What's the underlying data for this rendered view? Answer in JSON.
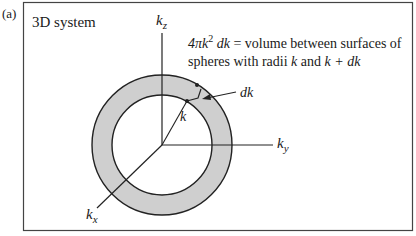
{
  "figure": {
    "panel_label": "(a)",
    "title": "3D system",
    "axes": {
      "z": {
        "base": "k",
        "sub": "z"
      },
      "y": {
        "base": "k",
        "sub": "y"
      },
      "x": {
        "base": "k",
        "sub": "x"
      }
    },
    "annotation": {
      "line1": {
        "prefix": "4πk",
        "sup": "2",
        "italic_part": " dk",
        "rest": " = volume between surfaces of"
      },
      "line2": {
        "part1": "spheres with radii ",
        "k1": "k",
        "part2": " and ",
        "k2": "k + dk"
      }
    },
    "labels": {
      "radius": "k",
      "shell_thickness": "dk"
    },
    "colors": {
      "shell_fill": "#cfcfcf",
      "stroke": "#222222",
      "frame": "#444444"
    }
  }
}
